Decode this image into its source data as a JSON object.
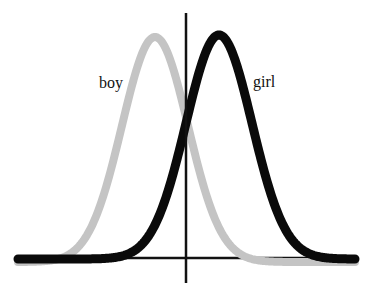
{
  "figure": {
    "type": "two overlapping normal distributions",
    "labels": {
      "boy": "boy",
      "girl": "girl"
    },
    "colors": {
      "boy": "#c4c4c4",
      "girl": "#0a0a0a",
      "axis": "#111111",
      "background": "#ffffff"
    }
  },
  "chart_data": {
    "type": "line",
    "title": "",
    "xlabel": "",
    "ylabel": "",
    "grid": false,
    "legend": "inline labels",
    "axes": {
      "vertical_axis_x_px": 186,
      "vertical_axis_top_px": 13,
      "vertical_axis_bottom_px": 283,
      "baseline_y_px": 258,
      "baseline_left_px": 18,
      "baseline_right_px": 355
    },
    "series": [
      {
        "name": "boy",
        "color": "#c4c4c4",
        "stroke_width": 8,
        "distribution": "normal",
        "mean_px": 155,
        "sd_px": 33,
        "peak_y_px": 37,
        "baseline_y_px": 262,
        "x_range_px": [
          18,
          355
        ]
      },
      {
        "name": "girl",
        "color": "#0a0a0a",
        "stroke_width": 9,
        "distribution": "normal",
        "mean_px": 219,
        "sd_px": 33,
        "peak_y_px": 35,
        "baseline_y_px": 259,
        "x_range_px": [
          18,
          355
        ]
      }
    ]
  }
}
